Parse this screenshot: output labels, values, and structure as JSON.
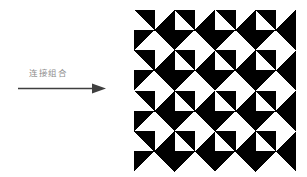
{
  "canvas": {
    "width": 307,
    "height": 177,
    "background": "#ffffff"
  },
  "transition": {
    "label": "连接组合",
    "label_color": "#8d8d8d",
    "arrow_name": "right-arrow",
    "arrow_color": "#3f3f3f",
    "arrow_from_x": 20,
    "arrow_to_x": 105,
    "arrow_y": 89
  },
  "pattern": {
    "title": "pinwheel-tiling",
    "motif": "half-square-triangle",
    "fill_color": "#000000",
    "background_color": "#ffffff",
    "grid_columns": 8,
    "grid_rows": 8,
    "cell_size": 20.25,
    "origin_x": 134,
    "origin_y": 10,
    "width": 162,
    "height": 162,
    "tile_period": 2,
    "tile_description": "2x2 pinwheel block repeated 4x4 times",
    "orientation_codes": [
      "TR",
      "BR",
      "TL",
      "BL"
    ],
    "orientation_legend": {
      "TR": "black triangle occupies top-right half",
      "BR": "black triangle occupies bottom-right half",
      "TL": "black triangle occupies top-left half",
      "BL": "black triangle occupies bottom-left half"
    },
    "grid": [
      [
        "TR",
        "BR",
        "TR",
        "BR",
        "TR",
        "BR",
        "TR",
        "BR"
      ],
      [
        "TL",
        "TR",
        "TL",
        "TR",
        "TL",
        "TR",
        "TL",
        "TR"
      ],
      [
        "TR",
        "BR",
        "TR",
        "BR",
        "TR",
        "BR",
        "TR",
        "BR"
      ],
      [
        "TL",
        "TR",
        "TL",
        "TR",
        "TL",
        "TR",
        "TL",
        "TR"
      ],
      [
        "TR",
        "BR",
        "TR",
        "BR",
        "TR",
        "BR",
        "TR",
        "BR"
      ],
      [
        "TL",
        "TR",
        "TL",
        "TR",
        "TL",
        "TR",
        "TL",
        "TR"
      ],
      [
        "TR",
        "BR",
        "TR",
        "BR",
        "TR",
        "BR",
        "TR",
        "BR"
      ],
      [
        "TL",
        "TR",
        "TL",
        "TR",
        "TL",
        "TR",
        "TL",
        "TR"
      ]
    ]
  }
}
